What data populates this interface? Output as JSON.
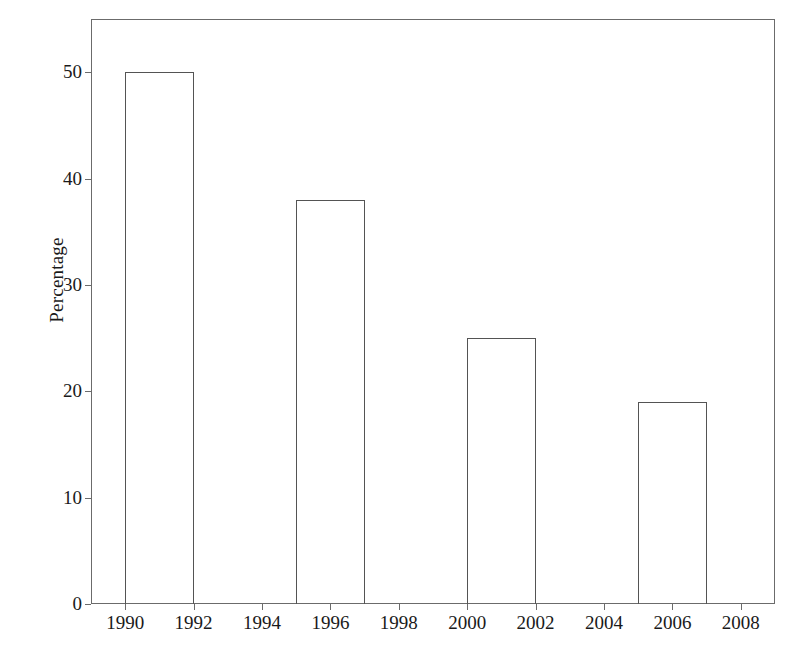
{
  "chart_data": {
    "type": "bar",
    "title": "",
    "subtitle": "",
    "xlabel": "",
    "ylabel": "Percentage",
    "grid": false,
    "legend": null,
    "legend_position": "none",
    "bar_style": "outlined-unfilled",
    "xlim": [
      1989,
      2009
    ],
    "ylim": [
      0,
      55
    ],
    "x_tick_labels": [
      "1990",
      "1992",
      "1994",
      "1996",
      "1998",
      "2000",
      "2002",
      "2004",
      "2006",
      "2008"
    ],
    "x_tick_values": [
      1990,
      1992,
      1994,
      1996,
      1998,
      2000,
      2002,
      2004,
      2006,
      2008
    ],
    "y_tick_labels": [
      "0",
      "10",
      "20",
      "30",
      "40",
      "50"
    ],
    "y_tick_values": [
      0,
      10,
      20,
      30,
      40,
      50
    ],
    "categories": [
      "1990",
      "1996",
      "2001",
      "2006"
    ],
    "values": [
      50,
      38,
      25,
      19
    ],
    "bars": [
      {
        "label": "1990",
        "value": 50,
        "x_start": 1990,
        "x_end": 1992
      },
      {
        "label": "1996",
        "value": 38,
        "x_start": 1995,
        "x_end": 1997
      },
      {
        "label": "2001",
        "value": 25,
        "x_start": 2000,
        "x_end": 2002
      },
      {
        "label": "2006",
        "value": 19,
        "x_start": 2005,
        "x_end": 2007
      }
    ],
    "colors": {
      "background": "#ffffff",
      "axis": "#6b6b6b",
      "bar_outline": "#545454",
      "bar_fill": "none",
      "text": "#1a1a1a"
    }
  }
}
